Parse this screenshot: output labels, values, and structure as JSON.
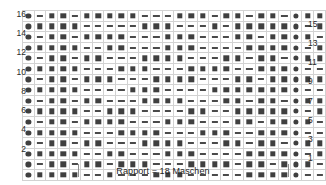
{
  "chart_data": {
    "type": "table",
    "columns": 26,
    "rows": 16,
    "symbol_legend": {
      "circle": "filled circle symbol",
      "square": "filled square symbol",
      "dash": "horizontal dash symbol"
    },
    "row_numbers_left": [
      16,
      14,
      12,
      10,
      8,
      6,
      4,
      2
    ],
    "row_numbers_right": [
      15,
      13,
      11,
      9,
      7,
      5,
      3,
      1
    ],
    "repeat_start_column": 5,
    "repeat_end_column": 23,
    "repeat_width": 18,
    "grid": [
      {
        "row": 16,
        "cells": [
          "circle",
          "dash",
          "square",
          "square",
          "dash",
          "square",
          "square",
          "square",
          "square",
          "square",
          "dash",
          "dash",
          "dash",
          "square",
          "square",
          "square",
          "dash",
          "square",
          "square",
          "dash",
          "square",
          "square",
          "dash",
          "circle",
          "square",
          "square"
        ]
      },
      {
        "row": 15,
        "cells": [
          "circle",
          "square",
          "square",
          "square",
          "square",
          "dash",
          "dash",
          "dash",
          "dash",
          "dash",
          "square",
          "square",
          "square",
          "dash",
          "dash",
          "dash",
          "square",
          "dash",
          "square",
          "square",
          "square",
          "square",
          "square",
          "circle",
          "dash",
          "square"
        ]
      },
      {
        "row": 14,
        "cells": [
          "circle",
          "dash",
          "square",
          "square",
          "dash",
          "square",
          "square",
          "square",
          "square",
          "dash",
          "dash",
          "dash",
          "square",
          "square",
          "square",
          "dash",
          "dash",
          "dash",
          "square",
          "square",
          "dash",
          "square",
          "square",
          "circle",
          "square",
          "dash"
        ]
      },
      {
        "row": 13,
        "cells": [
          "circle",
          "square",
          "square",
          "square",
          "square",
          "dash",
          "dash",
          "square",
          "square",
          "dash",
          "dash",
          "dash",
          "square",
          "square",
          "square",
          "dash",
          "dash",
          "dash",
          "dash",
          "square",
          "square",
          "square",
          "square",
          "circle",
          "dash",
          "square"
        ]
      },
      {
        "row": 12,
        "cells": [
          "circle",
          "dash",
          "square",
          "square",
          "dash",
          "square",
          "square",
          "dash",
          "dash",
          "dash",
          "square",
          "square",
          "square",
          "square",
          "dash",
          "dash",
          "dash",
          "square",
          "square",
          "dash",
          "square",
          "square",
          "dash",
          "circle",
          "square",
          "square"
        ]
      },
      {
        "row": 11,
        "cells": [
          "circle",
          "square",
          "square",
          "square",
          "square",
          "dash",
          "dash",
          "dash",
          "square",
          "square",
          "square",
          "dash",
          "dash",
          "dash",
          "square",
          "square",
          "square",
          "square",
          "dash",
          "dash",
          "square",
          "square",
          "square",
          "circle",
          "dash",
          "dash"
        ]
      },
      {
        "row": 10,
        "cells": [
          "circle",
          "dash",
          "square",
          "square",
          "dash",
          "square",
          "square",
          "square",
          "dash",
          "dash",
          "dash",
          "square",
          "square",
          "square",
          "square",
          "dash",
          "dash",
          "dash",
          "square",
          "square",
          "dash",
          "square",
          "square",
          "circle",
          "square",
          "square"
        ]
      },
      {
        "row": 9,
        "cells": [
          "circle",
          "square",
          "square",
          "square",
          "square",
          "dash",
          "dash",
          "dash",
          "dash",
          "square",
          "square",
          "square",
          "dash",
          "dash",
          "dash",
          "dash",
          "square",
          "square",
          "square",
          "square",
          "square",
          "square",
          "square",
          "circle",
          "dash",
          "dash"
        ]
      },
      {
        "row": 8,
        "cells": [
          "circle",
          "dash",
          "square",
          "square",
          "dash",
          "square",
          "square",
          "dash",
          "dash",
          "dash",
          "square",
          "square",
          "square",
          "square",
          "dash",
          "dash",
          "dash",
          "square",
          "square",
          "dash",
          "square",
          "square",
          "dash",
          "circle",
          "square",
          "square"
        ]
      },
      {
        "row": 7,
        "cells": [
          "circle",
          "square",
          "square",
          "square",
          "square",
          "dash",
          "dash",
          "square",
          "square",
          "square",
          "dash",
          "dash",
          "dash",
          "dash",
          "square",
          "square",
          "dash",
          "dash",
          "square",
          "square",
          "square",
          "square",
          "square",
          "circle",
          "dash",
          "square"
        ]
      },
      {
        "row": 6,
        "cells": [
          "circle",
          "dash",
          "square",
          "square",
          "dash",
          "square",
          "square",
          "square",
          "square",
          "dash",
          "dash",
          "dash",
          "square",
          "square",
          "square",
          "dash",
          "dash",
          "dash",
          "square",
          "square",
          "dash",
          "square",
          "square",
          "circle",
          "square",
          "dash"
        ]
      },
      {
        "row": 5,
        "cells": [
          "circle",
          "square",
          "square",
          "square",
          "square",
          "dash",
          "dash",
          "dash",
          "square",
          "square",
          "square",
          "square",
          "dash",
          "dash",
          "dash",
          "square",
          "square",
          "square",
          "dash",
          "dash",
          "square",
          "square",
          "square",
          "circle",
          "dash",
          "dash"
        ]
      },
      {
        "row": 4,
        "cells": [
          "circle",
          "dash",
          "square",
          "square",
          "dash",
          "square",
          "square",
          "dash",
          "dash",
          "dash",
          "square",
          "square",
          "square",
          "square",
          "dash",
          "dash",
          "dash",
          "square",
          "square",
          "dash",
          "square",
          "square",
          "dash",
          "circle",
          "square",
          "square"
        ]
      },
      {
        "row": 3,
        "cells": [
          "circle",
          "square",
          "square",
          "square",
          "square",
          "dash",
          "dash",
          "square",
          "square",
          "dash",
          "dash",
          "dash",
          "square",
          "square",
          "square",
          "dash",
          "dash",
          "dash",
          "dash",
          "square",
          "square",
          "square",
          "square",
          "circle",
          "dash",
          "square"
        ]
      },
      {
        "row": 2,
        "cells": [
          "circle",
          "dash",
          "square",
          "square",
          "dash",
          "square",
          "square",
          "dash",
          "square",
          "square",
          "square",
          "dash",
          "dash",
          "dash",
          "square",
          "square",
          "square",
          "square",
          "dash",
          "square",
          "square",
          "dash",
          "square",
          "circle",
          "square",
          "dash"
        ]
      },
      {
        "row": 1,
        "cells": [
          "circle",
          "square",
          "square",
          "square",
          "square",
          "dash",
          "dash",
          "square",
          "dash",
          "dash",
          "dash",
          "square",
          "square",
          "square",
          "dash",
          "dash",
          "dash",
          "dash",
          "dash",
          "square",
          "square",
          "square",
          "square",
          "circle",
          "dash",
          "dash"
        ]
      }
    ]
  },
  "caption": {
    "text": "Rapport = 18 Maschen"
  }
}
